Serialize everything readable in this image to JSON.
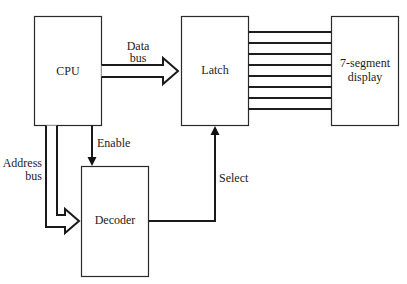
{
  "diagram": {
    "blocks": {
      "cpu": "CPU",
      "latch": "Latch",
      "display_line1": "7-segment",
      "display_line2": "display",
      "decoder": "Decoder"
    },
    "labels": {
      "data_bus_line1": "Data",
      "data_bus_line2": "bus",
      "address_bus_line1": "Address",
      "address_bus_line2": "bus",
      "enable": "Enable",
      "select": "Select"
    },
    "latch_to_display_line_count": 8
  }
}
